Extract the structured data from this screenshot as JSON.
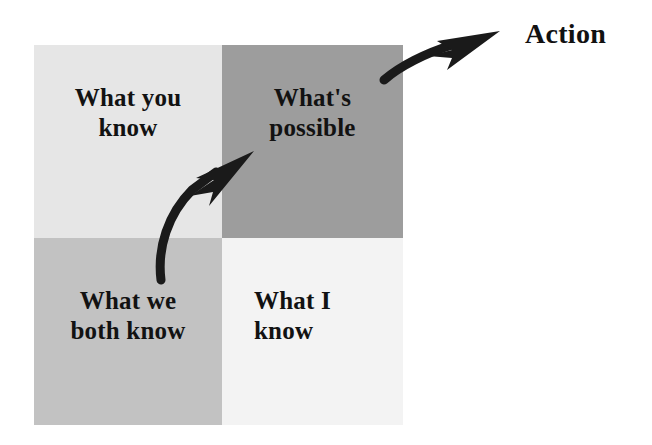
{
  "diagram": {
    "title_label": "Action",
    "quadrants": [
      {
        "id": "what-you-know",
        "label": "What you\nknow",
        "line1": "What you",
        "line2": "know",
        "fill": "#e6e6e6",
        "position": "top-left"
      },
      {
        "id": "whats-possible",
        "label": "What's\npossible",
        "line1": "What's",
        "line2": "possible",
        "fill": "#9d9d9d",
        "position": "top-right"
      },
      {
        "id": "what-we-both-know",
        "label": "What we\nboth know",
        "line1": "What we",
        "line2": "both know",
        "fill": "#c2c2c2",
        "position": "bottom-left"
      },
      {
        "id": "what-i-know",
        "label": "What I\nknow",
        "line1": "What I",
        "line2": "know",
        "fill": "#f3f3f3",
        "position": "bottom-right"
      }
    ],
    "arrows": [
      {
        "id": "arrow-to-possible",
        "from": "what-we-both-know",
        "to": "whats-possible",
        "color": "#1a1a1a"
      },
      {
        "id": "arrow-to-action",
        "from": "whats-possible",
        "to": "Action",
        "color": "#1a1a1a"
      }
    ],
    "colors": {
      "text": "#121212",
      "arrow": "#1a1a1a",
      "background": "#ffffff"
    }
  }
}
